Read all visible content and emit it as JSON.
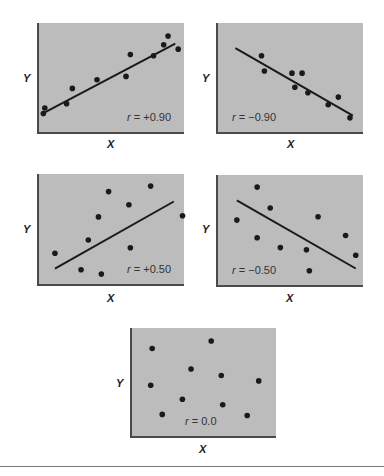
{
  "chart_data": [
    {
      "type": "scatter",
      "id": "p1",
      "title": "",
      "xlabel": "X",
      "ylabel": "Y",
      "annotation": "r = +0.90",
      "r": 0.9,
      "xlim": [
        0,
        1
      ],
      "ylim": [
        0,
        1
      ],
      "grid": false,
      "points": [
        [
          0.03,
          0.17
        ],
        [
          0.04,
          0.22
        ],
        [
          0.19,
          0.26
        ],
        [
          0.23,
          0.4
        ],
        [
          0.4,
          0.48
        ],
        [
          0.6,
          0.51
        ],
        [
          0.63,
          0.71
        ],
        [
          0.79,
          0.7
        ],
        [
          0.86,
          0.8
        ],
        [
          0.89,
          0.88
        ],
        [
          0.96,
          0.76
        ]
      ],
      "fit_line": [
        [
          0.04,
          0.18
        ],
        [
          0.94,
          0.81
        ]
      ]
    },
    {
      "type": "scatter",
      "id": "p2",
      "xlabel": "X",
      "ylabel": "Y",
      "annotation": "r = −0.90",
      "r": -0.9,
      "xlim": [
        0,
        1
      ],
      "ylim": [
        0,
        1
      ],
      "grid": false,
      "points": [
        [
          0.3,
          0.7
        ],
        [
          0.32,
          0.56
        ],
        [
          0.51,
          0.54
        ],
        [
          0.58,
          0.54
        ],
        [
          0.53,
          0.41
        ],
        [
          0.62,
          0.36
        ],
        [
          0.76,
          0.25
        ],
        [
          0.83,
          0.32
        ],
        [
          0.91,
          0.13
        ]
      ],
      "fit_line": [
        [
          0.12,
          0.77
        ],
        [
          0.93,
          0.15
        ]
      ]
    },
    {
      "type": "scatter",
      "id": "p3",
      "xlabel": "X",
      "ylabel": "Y",
      "annotation": "r = +0.50",
      "r": 0.5,
      "xlim": [
        0,
        1
      ],
      "ylim": [
        0,
        1
      ],
      "grid": false,
      "points": [
        [
          0.11,
          0.28
        ],
        [
          0.29,
          0.13
        ],
        [
          0.34,
          0.4
        ],
        [
          0.41,
          0.61
        ],
        [
          0.48,
          0.84
        ],
        [
          0.43,
          0.09
        ],
        [
          0.62,
          0.72
        ],
        [
          0.63,
          0.33
        ],
        [
          0.77,
          0.89
        ],
        [
          0.99,
          0.62
        ]
      ],
      "fit_line": [
        [
          0.11,
          0.14
        ],
        [
          0.93,
          0.75
        ]
      ]
    },
    {
      "type": "scatter",
      "id": "p4",
      "xlabel": "X",
      "ylabel": "Y",
      "annotation": "r = −0.50",
      "r": -0.5,
      "xlim": [
        0,
        1
      ],
      "ylim": [
        0,
        1
      ],
      "grid": false,
      "points": [
        [
          0.13,
          0.59
        ],
        [
          0.27,
          0.89
        ],
        [
          0.36,
          0.7
        ],
        [
          0.27,
          0.43
        ],
        [
          0.43,
          0.34
        ],
        [
          0.61,
          0.32
        ],
        [
          0.69,
          0.62
        ],
        [
          0.63,
          0.13
        ],
        [
          0.88,
          0.45
        ],
        [
          0.95,
          0.27
        ]
      ],
      "fit_line": [
        [
          0.13,
          0.77
        ],
        [
          0.95,
          0.15
        ]
      ]
    },
    {
      "type": "scatter",
      "id": "p5",
      "xlabel": "X",
      "ylabel": "Y",
      "annotation": "r = 0.0",
      "r": 0.0,
      "xlim": [
        0,
        1
      ],
      "ylim": [
        0,
        1
      ],
      "grid": false,
      "points": [
        [
          0.14,
          0.81
        ],
        [
          0.55,
          0.88
        ],
        [
          0.41,
          0.62
        ],
        [
          0.62,
          0.56
        ],
        [
          0.13,
          0.47
        ],
        [
          0.88,
          0.51
        ],
        [
          0.35,
          0.34
        ],
        [
          0.63,
          0.29
        ],
        [
          0.21,
          0.2
        ],
        [
          0.8,
          0.19
        ]
      ],
      "fit_line": null
    }
  ],
  "labels": {
    "x": "X",
    "y": "Y",
    "r_symbol": "r",
    "p1_value": "= +0.90",
    "p2_value": "= −0.90",
    "p3_value": "= +0.50",
    "p4_value": "= −0.50",
    "p5_value": "= 0.0"
  },
  "colors": {
    "panel_fill": "#bcbcbc",
    "axis": "#4a4a4a",
    "point": "#1a1a1a",
    "line": "#1a1a1a"
  }
}
